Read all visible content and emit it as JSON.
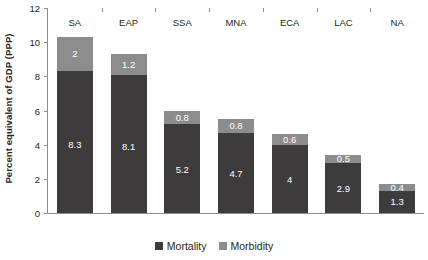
{
  "chart_data": {
    "type": "bar",
    "stacked": true,
    "title": "",
    "xlabel": "",
    "ylabel": "Percent equivalent of GDP (PPP)",
    "ylim": [
      0,
      12
    ],
    "ytick_step": 2,
    "yticks": [
      "12",
      "10",
      "8",
      "6",
      "4",
      "2",
      "0"
    ],
    "grid": false,
    "legend_position": "bottom-center",
    "categories": [
      "SA",
      "EAP",
      "SSA",
      "MNA",
      "ECA",
      "LAC",
      "NA"
    ],
    "series": [
      {
        "name": "Mortality",
        "color": "#3d3b3c",
        "values": [
          8.3,
          8.1,
          5.2,
          4.7,
          4,
          2.9,
          1.3
        ],
        "labels": [
          "8.3",
          "8.1",
          "5.2",
          "4.7",
          "4",
          "2.9",
          "1.3"
        ]
      },
      {
        "name": "Morbidity",
        "color": "#8c8c8c",
        "values": [
          2,
          1.2,
          0.8,
          0.8,
          0.6,
          0.5,
          0.4
        ],
        "labels": [
          "2",
          "1.2",
          "0.8",
          "0.8",
          "0.6",
          "0.5",
          "0.4"
        ]
      }
    ],
    "totals": [
      10.3,
      9.3,
      6.0,
      5.5,
      4.6,
      3.4,
      1.7
    ]
  },
  "legend": {
    "items": [
      {
        "label": "Mortality",
        "color": "#3d3b3c"
      },
      {
        "label": "Morbidity",
        "color": "#8c8c8c"
      }
    ]
  },
  "axis": {
    "y_title": "Percent equivalent of GDP (PPP)",
    "axis_color": "#8d8d8d"
  }
}
